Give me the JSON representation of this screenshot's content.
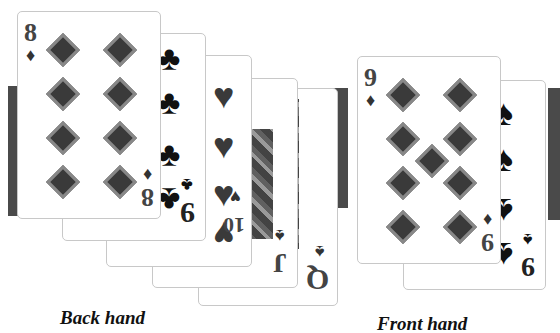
{
  "captions": {
    "back_hand": "Back hand",
    "front_hand": "Front hand"
  },
  "back_hand": {
    "cards": [
      {
        "rank": "8",
        "suit": "diamonds",
        "suit_glyph": "♦"
      },
      {
        "rank": "9",
        "suit": "clubs",
        "suit_glyph": "♣"
      },
      {
        "rank": "10",
        "suit": "hearts",
        "suit_glyph": "♥"
      },
      {
        "rank": "J",
        "suit": "spades",
        "suit_glyph": "♠"
      },
      {
        "rank": "Q",
        "suit": "spades",
        "suit_glyph": "♠"
      }
    ]
  },
  "front_hand": {
    "cards": [
      {
        "rank": "9",
        "suit": "diamonds",
        "suit_glyph": "♦"
      },
      {
        "rank": "9",
        "suit": "spades",
        "suit_glyph": "♠"
      }
    ]
  },
  "colors": {
    "bar": "#4a4a4a",
    "card_border": "#c8c8c8",
    "pip": "#3a3a3a"
  }
}
